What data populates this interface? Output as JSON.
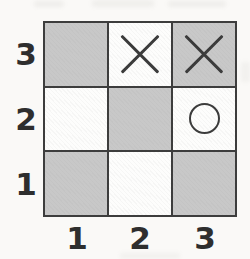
{
  "board": {
    "description": "3x3 coordinate grid game board with checkerboard shading",
    "row_labels": [
      "3",
      "2",
      "1"
    ],
    "col_labels": [
      "1",
      "2",
      "3"
    ],
    "cells": [
      {
        "id": "r3c1",
        "row": "3",
        "col": "1",
        "fill": "gray",
        "mark": ""
      },
      {
        "id": "r3c2",
        "row": "3",
        "col": "2",
        "fill": "white",
        "mark": "X"
      },
      {
        "id": "r3c3",
        "row": "3",
        "col": "3",
        "fill": "gray",
        "mark": "X"
      },
      {
        "id": "r2c1",
        "row": "2",
        "col": "1",
        "fill": "white",
        "mark": ""
      },
      {
        "id": "r2c2",
        "row": "2",
        "col": "2",
        "fill": "gray",
        "mark": ""
      },
      {
        "id": "r2c3",
        "row": "2",
        "col": "3",
        "fill": "white",
        "mark": "O"
      },
      {
        "id": "r1c1",
        "row": "1",
        "col": "1",
        "fill": "gray",
        "mark": ""
      },
      {
        "id": "r1c2",
        "row": "1",
        "col": "2",
        "fill": "white",
        "mark": ""
      },
      {
        "id": "r1c3",
        "row": "1",
        "col": "3",
        "fill": "gray",
        "mark": ""
      }
    ],
    "marks": [
      {
        "symbol": "X",
        "column": 2,
        "row": 3
      },
      {
        "symbol": "X",
        "column": 3,
        "row": 3
      },
      {
        "symbol": "O",
        "column": 3,
        "row": 2
      }
    ]
  },
  "colors": {
    "shaded_cell": "#c8c8c8",
    "open_cell": "#fdfdfc",
    "grid_line": "#3d3d3d",
    "mark_stroke": "#3a3a3a",
    "label_text": "#2e2e2e",
    "page_background": "#faf9f7"
  }
}
